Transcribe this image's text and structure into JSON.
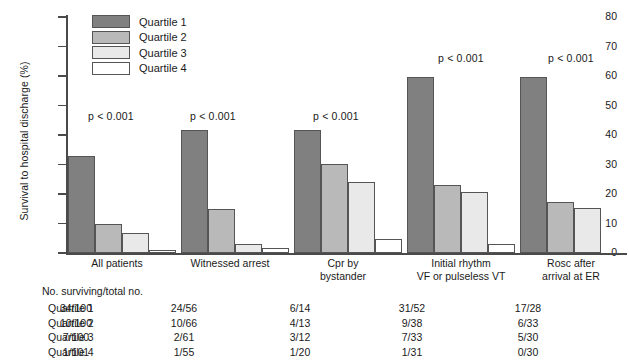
{
  "chart_data": {
    "type": "bar",
    "title": "",
    "xlabel": "",
    "ylabel": "Survival to hospital discharge (%)",
    "ylim": [
      0,
      80
    ],
    "yticks": [
      0,
      10,
      20,
      30,
      40,
      50,
      60,
      70,
      80
    ],
    "grid": false,
    "legend_position": "top-left-inside",
    "categories": [
      "All patients",
      "Witnessed arrest",
      "Cpr by bystander",
      "Initial rhythm VF or pulseless VT",
      "Rosc after arrival at ER"
    ],
    "category_lines": [
      [
        "All patients"
      ],
      [
        "Witnessed arrest"
      ],
      [
        "Cpr by",
        "bystander"
      ],
      [
        "Initial rhythm",
        "VF or pulseless VT"
      ],
      [
        "Rosc after",
        "arrival at ER"
      ]
    ],
    "series": [
      {
        "name": "Quartile 1",
        "color": "#808080",
        "values": [
          33.0,
          41.8,
          41.8,
          59.5,
          59.5
        ]
      },
      {
        "name": "Quartile 2",
        "color": "#b9b9b9",
        "values": [
          10.0,
          15.0,
          30.3,
          23.0,
          17.2
        ]
      },
      {
        "name": "Quartile 3",
        "color": "#e9e9e9",
        "values": [
          6.9,
          3.1,
          24.0,
          20.7,
          15.2
        ]
      },
      {
        "name": "Quartile 4",
        "color": "#ffffff",
        "values": [
          1.0,
          1.6,
          4.8,
          3.0,
          0.0
        ]
      }
    ],
    "annotations": [
      {
        "text": "p < 0.001",
        "category": "All patients"
      },
      {
        "text": "p < 0.001",
        "category": "Witnessed arrest"
      },
      {
        "text": "p < 0.001",
        "category": "Cpr by bystander"
      },
      {
        "text": "p < 0.001",
        "category": "Initial rhythm VF or pulseless VT"
      },
      {
        "text": "p < 0.001",
        "category": "Rosc after arrival at ER"
      }
    ]
  },
  "legend": {
    "items": [
      {
        "label": "Quartile 1",
        "color": "#808080"
      },
      {
        "label": "Quartile 2",
        "color": "#b9b9b9"
      },
      {
        "label": "Quartile 3",
        "color": "#e9e9e9"
      },
      {
        "label": "Quartile 4",
        "color": "#ffffff"
      }
    ]
  },
  "yaxis": {
    "label": "Survival to hospital discharge (%)",
    "ticks": [
      "80",
      "70",
      "60",
      "50",
      "40",
      "30",
      "20",
      "10",
      "0"
    ]
  },
  "pvalues": {
    "g1": "p < 0.001",
    "g2": "p < 0.001",
    "g3": "p < 0.001",
    "g4": "p < 0.001",
    "g5": "p < 0.001"
  },
  "xlabels": {
    "g1_l1": "All patients",
    "g1_l2": "",
    "g2_l1": "Witnessed arrest",
    "g2_l2": "",
    "g3_l1": "Cpr by",
    "g3_l2": "bystander",
    "g4_l1": "Initial rhythm",
    "g4_l2": "VF or pulseless VT",
    "g5_l1": "Rosc after",
    "g5_l2": "arrival at ER"
  },
  "table": {
    "header": "No. surviving/total no.",
    "row_labels": [
      "Quartile 1",
      "Quartile 2",
      "Quartile 3",
      "Quartile 4"
    ],
    "columns": [
      "All patients",
      "Witnessed arrest",
      "Cpr by bystander",
      "Initial rhythm VF or pulseless VT",
      "Rosc after arrival at ER"
    ],
    "rows": [
      {
        "label": "Quartile 1",
        "values": [
          "34/100",
          "24/56",
          "6/14",
          "31/52",
          "17/28"
        ]
      },
      {
        "label": "Quartile 2",
        "values": [
          "10/100",
          "10/66",
          "4/13",
          "9/38",
          "6/33"
        ]
      },
      {
        "label": "Quartile 3",
        "values": [
          "7/100",
          "2/61",
          "3/12",
          "7/33",
          "5/30"
        ]
      },
      {
        "label": "Quartile 4",
        "values": [
          "1/101",
          "1/55",
          "1/20",
          "1/31",
          "0/30"
        ]
      }
    ]
  },
  "colors": {
    "q1": "#808080",
    "q2": "#b9b9b9",
    "q3": "#e9e9e9",
    "q4": "#ffffff",
    "axis": "#4a4a4a",
    "bar_border": "#555555",
    "text": "#1a1a1a"
  }
}
